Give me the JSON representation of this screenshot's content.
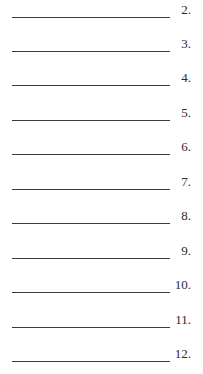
{
  "worksheet": {
    "items": [
      {
        "number": "2."
      },
      {
        "number": "3."
      },
      {
        "number": "4."
      },
      {
        "number": "5."
      },
      {
        "number": "6."
      },
      {
        "number": "7."
      },
      {
        "number": "8."
      },
      {
        "number": "9."
      },
      {
        "number": "10."
      },
      {
        "number": "11."
      },
      {
        "number": "12."
      }
    ]
  }
}
